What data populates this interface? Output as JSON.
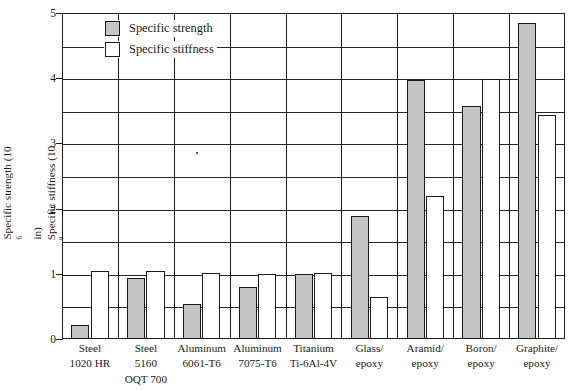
{
  "chart_data": {
    "type": "bar",
    "title": "",
    "xlabel": "",
    "ylabel_line1": "Specific strength (10⁶ in)",
    "ylabel_line2": "Specific stiffness (10⁸ in)",
    "ylabel_parts": {
      "line1_pre": "Specific strength (10",
      "line1_sup": "6",
      "line1_post": " in)",
      "line2_pre": "Specific stiffness (10",
      "line2_sup": "8",
      "line2_post": " in)"
    },
    "categories": [
      "Steel 1020 HR",
      "Steel 5160 OQT 700",
      "Aluminum 6061-T6",
      "Aluminum 7075-T6",
      "Titanium Ti-6Al-4V",
      "Glass/epoxy",
      "Aramid/epoxy",
      "Boron/epoxy",
      "Graphite/epoxy"
    ],
    "category_lines": [
      [
        "Steel",
        "1020 HR"
      ],
      [
        "Steel",
        "5160",
        "OQT 700"
      ],
      [
        "Aluminum",
        "6061-T6"
      ],
      [
        "Aluminum",
        "7075-T6"
      ],
      [
        "Titanium",
        "Ti-6Al-4V"
      ],
      [
        "Glass/",
        "epoxy"
      ],
      [
        "Aramid/",
        "epoxy"
      ],
      [
        "Boron/",
        "epoxy"
      ],
      [
        "Graphite/",
        "epoxy"
      ]
    ],
    "series": [
      {
        "name": "Specific strength",
        "color": "#c4c4c4",
        "values": [
          0.22,
          0.93,
          0.53,
          0.8,
          0.99,
          1.89,
          3.98,
          3.58,
          4.84
        ]
      },
      {
        "name": "Specific stiffness",
        "color": "#ffffff",
        "values": [
          1.05,
          1.05,
          1.02,
          1.0,
          1.01,
          0.64,
          2.2,
          3.99,
          3.44
        ]
      }
    ],
    "ylim": [
      0,
      5
    ],
    "ytick_labels": [
      "0",
      "1",
      "2",
      "3",
      "4",
      "5"
    ],
    "yticks": [
      0,
      1,
      2,
      3,
      4,
      5
    ],
    "gridlines": [
      0,
      0.5,
      1,
      1.5,
      2,
      2.5,
      3,
      3.5,
      4,
      4.5,
      5
    ],
    "grid": true,
    "legend_position": "top-left-inside",
    "legend": [
      {
        "label": "Specific strength",
        "swatch": "strength"
      },
      {
        "label": "Specific stiffness",
        "swatch": "stiffness"
      }
    ],
    "colors": {
      "strength_fill": "#c4c4c4",
      "stiffness_fill": "#ffffff",
      "outline": "#1a1a1a",
      "grid": "#262626",
      "background": "#ffffff"
    }
  }
}
